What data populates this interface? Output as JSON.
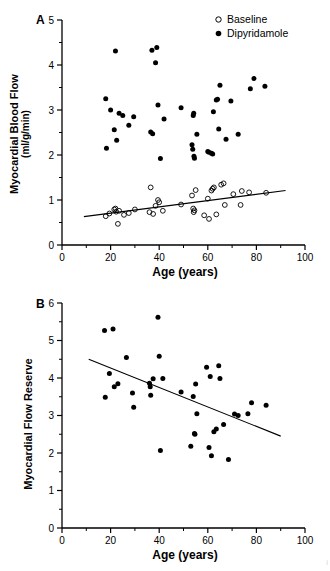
{
  "figure": {
    "panels": [
      {
        "letter": "A",
        "ylabel_line1": "Myocardial Blood Flow",
        "ylabel_line2": "(ml/g/min)",
        "xlabel": "Age (years)"
      },
      {
        "letter": "B",
        "ylabel_line1": "Myocardial Flow Reserve",
        "ylabel_line2": "",
        "xlabel": "Age (years)"
      }
    ],
    "legend": [
      {
        "label": "Baseline",
        "marker": "open-circle-icon",
        "color": "#000000"
      },
      {
        "label": "Dipyridamole",
        "marker": "filled-circle-icon",
        "color": "#000000"
      }
    ],
    "footer_note": "i"
  },
  "chart_data": [
    {
      "type": "scatter",
      "panel": "A",
      "title": "",
      "xlabel": "Age (years)",
      "ylabel": "Myocardial Blood Flow (ml/g/min)",
      "xlim": [
        0,
        100
      ],
      "ylim": [
        0,
        5
      ],
      "xticks": [
        0,
        20,
        40,
        60,
        80,
        100
      ],
      "yticks": [
        0,
        1,
        2,
        3,
        4,
        5
      ],
      "xminorticks": [
        10,
        30,
        50,
        70,
        90
      ],
      "yminorticks": [
        0.5,
        1.5,
        2.5,
        3.5,
        4.5
      ],
      "grid": false,
      "legend_position": "top-right",
      "series": [
        {
          "name": "Dipyridamole",
          "marker": "filled-circle",
          "color": "#000000",
          "points": [
            [
              18.0,
              3.25
            ],
            [
              18.3,
              2.15
            ],
            [
              20.0,
              3.0
            ],
            [
              21.5,
              2.56
            ],
            [
              22.0,
              4.31
            ],
            [
              22.5,
              2.33
            ],
            [
              23.5,
              2.93
            ],
            [
              25.0,
              2.88
            ],
            [
              27.5,
              2.66
            ],
            [
              29.5,
              2.85
            ],
            [
              36.5,
              2.51
            ],
            [
              37.0,
              4.33
            ],
            [
              37.3,
              2.47
            ],
            [
              38.5,
              4.05
            ],
            [
              39.0,
              4.39
            ],
            [
              39.5,
              3.11
            ],
            [
              40.5,
              1.92
            ],
            [
              42.0,
              2.8
            ],
            [
              49.0,
              3.05
            ],
            [
              53.5,
              2.23
            ],
            [
              53.8,
              2.13
            ],
            [
              54.0,
              2.88
            ],
            [
              54.2,
              2.93
            ],
            [
              54.3,
              1.97
            ],
            [
              54.5,
              1.93
            ],
            [
              55.5,
              2.46
            ],
            [
              60.0,
              2.08
            ],
            [
              60.5,
              2.06
            ],
            [
              61.5,
              2.04
            ],
            [
              62.0,
              2.02
            ],
            [
              62.3,
              2.96
            ],
            [
              63.5,
              3.22
            ],
            [
              64.0,
              3.24
            ],
            [
              64.5,
              2.58
            ],
            [
              65.0,
              3.55
            ],
            [
              67.5,
              2.35
            ],
            [
              69.5,
              3.2
            ],
            [
              72.5,
              2.46
            ],
            [
              77.5,
              3.47
            ],
            [
              79.0,
              3.7
            ],
            [
              83.5,
              3.53
            ]
          ]
        },
        {
          "name": "Baseline",
          "marker": "open-circle",
          "color": "#000000",
          "points": [
            [
              18.0,
              0.64
            ],
            [
              19.5,
              0.7
            ],
            [
              21.5,
              0.79
            ],
            [
              22.0,
              0.81
            ],
            [
              22.3,
              0.74
            ],
            [
              23.0,
              0.47
            ],
            [
              23.5,
              0.76
            ],
            [
              25.5,
              0.67
            ],
            [
              27.5,
              0.71
            ],
            [
              30.0,
              0.79
            ],
            [
              36.0,
              0.73
            ],
            [
              36.5,
              1.28
            ],
            [
              37.5,
              0.69
            ],
            [
              38.5,
              0.87
            ],
            [
              39.5,
              1.0
            ],
            [
              40.0,
              0.95
            ],
            [
              41.5,
              0.76
            ],
            [
              49.0,
              0.9
            ],
            [
              53.5,
              1.1
            ],
            [
              54.0,
              0.81
            ],
            [
              54.2,
              0.73
            ],
            [
              54.5,
              0.77
            ],
            [
              55.0,
              1.22
            ],
            [
              58.5,
              0.66
            ],
            [
              60.0,
              1.03
            ],
            [
              60.5,
              0.58
            ],
            [
              61.5,
              1.21
            ],
            [
              62.0,
              1.25
            ],
            [
              62.5,
              1.28
            ],
            [
              63.5,
              0.68
            ],
            [
              65.5,
              1.34
            ],
            [
              66.5,
              1.37
            ],
            [
              67.0,
              0.89
            ],
            [
              70.5,
              1.13
            ],
            [
              73.5,
              0.89
            ],
            [
              74.0,
              1.2
            ],
            [
              77.0,
              1.17
            ],
            [
              84.0,
              1.16
            ]
          ]
        }
      ],
      "regression_lines": [
        {
          "series": "Baseline",
          "x_start": 9,
          "y_start": 0.63,
          "x_end": 92,
          "y_end": 1.21
        }
      ]
    },
    {
      "type": "scatter",
      "panel": "B",
      "title": "",
      "xlabel": "Age (years)",
      "ylabel": "Myocardial Flow Reserve",
      "xlim": [
        0,
        100
      ],
      "ylim": [
        0,
        6
      ],
      "xticks": [
        0,
        20,
        40,
        60,
        80,
        100
      ],
      "yticks": [
        0,
        1,
        2,
        3,
        4,
        5,
        6
      ],
      "xminorticks": [
        10,
        30,
        50,
        70,
        90
      ],
      "yminorticks": [
        0.5,
        1.5,
        2.5,
        3.5,
        4.5,
        5.5
      ],
      "grid": false,
      "legend_position": "none",
      "series": [
        {
          "name": "Myocardial Flow Reserve",
          "marker": "filled-circle",
          "color": "#000000",
          "points": [
            [
              17.5,
              5.27
            ],
            [
              17.8,
              3.49
            ],
            [
              19.5,
              4.12
            ],
            [
              21.0,
              5.31
            ],
            [
              21.5,
              3.77
            ],
            [
              23.0,
              3.85
            ],
            [
              26.5,
              4.55
            ],
            [
              29.0,
              3.6
            ],
            [
              29.5,
              3.22
            ],
            [
              36.0,
              3.86
            ],
            [
              36.3,
              3.77
            ],
            [
              36.5,
              3.54
            ],
            [
              37.5,
              3.98
            ],
            [
              39.5,
              5.62
            ],
            [
              40.0,
              4.58
            ],
            [
              40.5,
              2.07
            ],
            [
              41.5,
              3.99
            ],
            [
              49.0,
              3.63
            ],
            [
              53.0,
              2.18
            ],
            [
              54.0,
              3.51
            ],
            [
              54.5,
              2.52
            ],
            [
              54.7,
              2.5
            ],
            [
              55.0,
              3.84
            ],
            [
              55.5,
              3.05
            ],
            [
              59.5,
              4.29
            ],
            [
              60.5,
              2.15
            ],
            [
              61.0,
              4.04
            ],
            [
              61.5,
              1.93
            ],
            [
              62.5,
              2.57
            ],
            [
              63.5,
              2.64
            ],
            [
              64.5,
              4.33
            ],
            [
              65.0,
              3.99
            ],
            [
              66.5,
              2.76
            ],
            [
              68.5,
              1.83
            ],
            [
              71.0,
              3.04
            ],
            [
              72.5,
              3.0
            ],
            [
              76.5,
              3.05
            ],
            [
              78.0,
              3.34
            ],
            [
              84.0,
              3.27
            ]
          ]
        }
      ],
      "regression_lines": [
        {
          "series": "Myocardial Flow Reserve",
          "x_start": 11,
          "y_start": 4.5,
          "x_end": 90,
          "y_end": 2.45
        }
      ]
    }
  ]
}
